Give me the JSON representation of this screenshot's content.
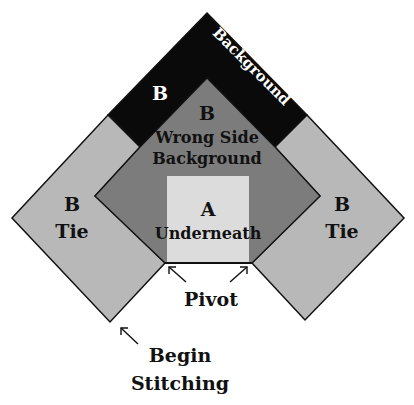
{
  "diagram": {
    "colors": {
      "background_band": "#0a0a0a",
      "tie": "#b8b8b8",
      "wrong_side": "#7c7c7c",
      "underneath": "#dcdcdc",
      "outline": "#111111",
      "text_dark": "#111111",
      "text_light": "#ffffff"
    },
    "labels": {
      "background_band_letter": "B",
      "background_band_text": "Background",
      "wrong_side_letter": "B",
      "wrong_side_line1": "Wrong Side",
      "wrong_side_line2": "Background",
      "underneath_letter": "A",
      "underneath_text": "Underneath",
      "left_tie_letter": "B",
      "left_tie_text": "Tie",
      "right_tie_letter": "B",
      "right_tie_text": "Tie",
      "pivot": "Pivot",
      "begin_line1": "Begin",
      "begin_line2": "Stitching"
    }
  }
}
